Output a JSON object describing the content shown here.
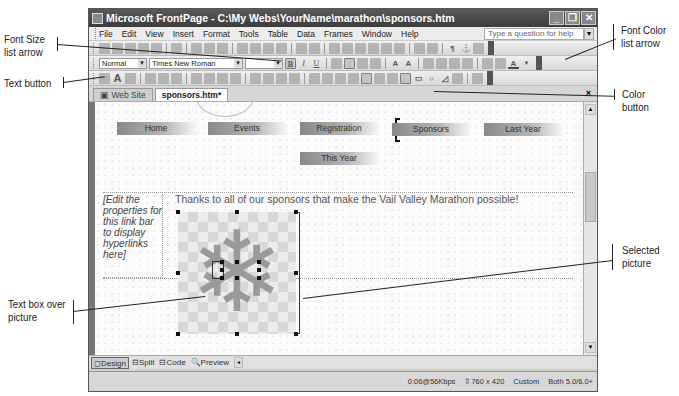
{
  "window": {
    "title": "Microsoft FrontPage - C:\\My Webs\\YourName\\marathon\\sponsors.htm",
    "controls": {
      "minimize": "_",
      "restore": "❐",
      "close": "✕"
    }
  },
  "menubar": {
    "items": [
      "File",
      "Edit",
      "View",
      "Insert",
      "Format",
      "Tools",
      "Table",
      "Data",
      "Frames",
      "Window",
      "Help"
    ],
    "help_placeholder": "Type a question for help"
  },
  "formatting_toolbar": {
    "style_value": "Normal",
    "font_value": "Times New Roman",
    "font_size_value": "",
    "bold": "B",
    "italic": "I",
    "underline": "U",
    "font_color_glyph": "A"
  },
  "pictures_toolbar": {
    "text_button_glyph": "A"
  },
  "tabs": [
    {
      "label": "Web Site",
      "active": false
    },
    {
      "label": "sponsors.htm*",
      "active": true
    }
  ],
  "tab_close": "×",
  "tag_selector": [
    "<body>",
    "<p>",
    "<img>"
  ],
  "page": {
    "nav_buttons": [
      {
        "label": "Home"
      },
      {
        "label": "Events"
      },
      {
        "label": "Registration"
      },
      {
        "label": "Sponsors",
        "selected": true
      },
      {
        "label": "Last Year"
      },
      {
        "label": "This Year"
      }
    ],
    "link_bar_placeholder": "[Edit the properties for this link bar to display hyperlinks here]",
    "thanks_text": "Thanks to all of our sponsors that make the Vail Valley Marathon possible!",
    "picture_glyph": "❄"
  },
  "view_tabs": [
    {
      "label": "Design",
      "icon": "◻",
      "active": true
    },
    {
      "label": "Split",
      "icon": "⊟",
      "active": false
    },
    {
      "label": "Code",
      "icon": "⊟",
      "active": false
    },
    {
      "label": "Preview",
      "icon": "🔍",
      "active": false
    }
  ],
  "statusbar": {
    "download_time": "0:06@56Kbps",
    "page_size": "760 x 420",
    "size_mode": "Custom",
    "browser_compat": "Both 5.0/6.0+"
  },
  "callouts": {
    "font_size_arrow": [
      "Font Size",
      "list arrow"
    ],
    "text_button": [
      "Text button"
    ],
    "text_box_over_picture": [
      "Text box over",
      "picture"
    ],
    "font_color_arrow": [
      "Font Color",
      "list arrow"
    ],
    "color_button": [
      "Color button"
    ],
    "selected_picture": [
      "Selected",
      "picture"
    ]
  }
}
